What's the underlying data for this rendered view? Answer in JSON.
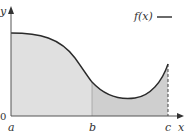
{
  "diagram": {
    "y_axis_label": "y",
    "x_axis_label": "x",
    "origin_label": "0",
    "legend_label": "f(x)",
    "points": [
      {
        "name": "a",
        "label": "a"
      },
      {
        "name": "b",
        "label": "b"
      },
      {
        "name": "c",
        "label": "c"
      }
    ],
    "regions": [
      {
        "name": "region-a-to-b",
        "from": "a",
        "to": "b",
        "color": "#e0e0e0"
      },
      {
        "name": "region-b-to-c",
        "from": "b",
        "to": "c",
        "color": "#cfcfcf"
      }
    ],
    "colors": {
      "curve": "#2a2a2a",
      "axis": "#555555"
    }
  }
}
